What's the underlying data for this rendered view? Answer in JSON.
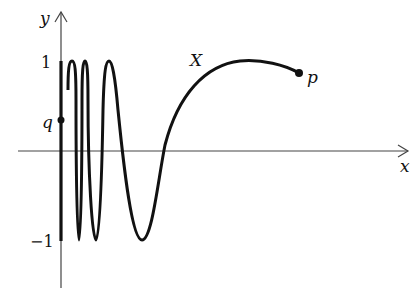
{
  "diagram": {
    "axes": {
      "x_label": "x",
      "y_label": "y",
      "y_tick_top": "1",
      "y_tick_bottom": "−1"
    },
    "curve_label": "X",
    "points": [
      {
        "name": "p",
        "label": "p"
      },
      {
        "name": "q",
        "label": "q"
      }
    ],
    "colors": {
      "stroke": "#111111",
      "background": "#ffffff"
    }
  }
}
